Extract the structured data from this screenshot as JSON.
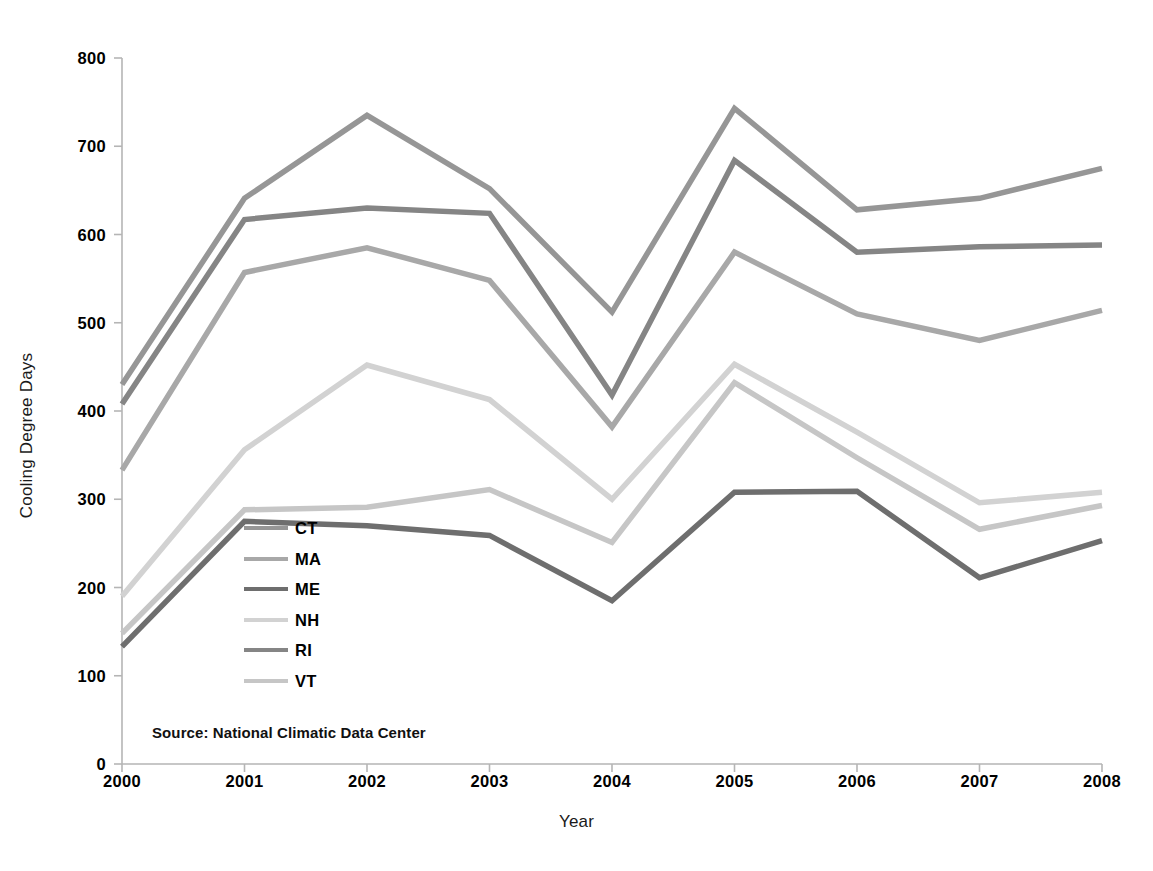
{
  "chart_data": {
    "type": "line",
    "title": "",
    "xlabel": "Year",
    "ylabel": "Cooling Degree Days",
    "categories": [
      "2000",
      "2001",
      "2002",
      "2003",
      "2004",
      "2005",
      "2006",
      "2007",
      "2008"
    ],
    "x": [
      2000,
      2001,
      2002,
      2003,
      2004,
      2005,
      2006,
      2007,
      2008
    ],
    "xlim": [
      2000,
      2008
    ],
    "ylim": [
      0,
      800
    ],
    "y_ticks": [
      0,
      100,
      200,
      300,
      400,
      500,
      600,
      700,
      800
    ],
    "x_ticks": [
      2000,
      2001,
      2002,
      2003,
      2004,
      2005,
      2006,
      2007,
      2008
    ],
    "grid": false,
    "legend_position": "inside-center-left",
    "series": [
      {
        "name": "CT",
        "color": "#969696",
        "values": [
          430,
          641,
          735,
          652,
          512,
          743,
          628,
          641,
          675
        ]
      },
      {
        "name": "MA",
        "color": "#a8a8a8",
        "values": [
          333,
          557,
          585,
          548,
          382,
          580,
          510,
          480,
          514
        ]
      },
      {
        "name": "ME",
        "color": "#6e6e6e",
        "values": [
          133,
          275,
          270,
          259,
          185,
          308,
          309,
          211,
          253
        ]
      },
      {
        "name": "NH",
        "color": "#d2d2d2",
        "values": [
          190,
          356,
          452,
          413,
          300,
          453,
          376,
          296,
          308
        ]
      },
      {
        "name": "RI",
        "color": "#858585",
        "values": [
          408,
          617,
          630,
          624,
          418,
          684,
          580,
          586,
          588
        ]
      },
      {
        "name": "VT",
        "color": "#c6c6c6",
        "values": [
          148,
          288,
          291,
          311,
          251,
          432,
          347,
          266,
          293
        ]
      }
    ],
    "annotations": [
      {
        "name": "source-note",
        "text": "Source: National Climatic Data Center"
      }
    ]
  },
  "legend": {
    "entries": [
      {
        "label": "CT"
      },
      {
        "label": "MA"
      },
      {
        "label": "ME"
      },
      {
        "label": "NH"
      },
      {
        "label": "RI"
      },
      {
        "label": "VT"
      }
    ]
  },
  "axes": {
    "y_title": "Cooling Degree Days",
    "x_title": "Year",
    "y_tick_labels": [
      "800",
      "700",
      "600",
      "500",
      "400",
      "300",
      "200",
      "100",
      "0"
    ],
    "x_tick_labels": [
      "2000",
      "2001",
      "2002",
      "2003",
      "2004",
      "2005",
      "2006",
      "2007",
      "2008"
    ],
    "axis_color": "#b5b5b5"
  },
  "source": {
    "text": "Source: National Climatic Data Center"
  }
}
